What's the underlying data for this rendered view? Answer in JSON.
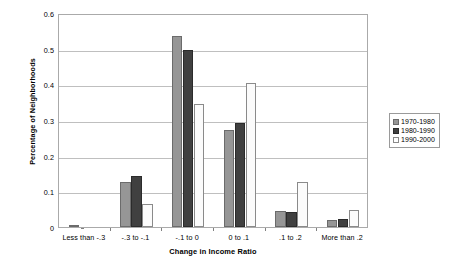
{
  "chart_data": {
    "type": "bar",
    "title": "",
    "xlabel": "Change in Income Ratio",
    "ylabel": "Percentage of Neighborhoods",
    "categories": [
      "Less than -.3",
      "-.3 to -.1",
      "-.1 to 0",
      "0 to .1",
      ".1 to .2",
      "More than .2"
    ],
    "series": [
      {
        "name": "1970-1980",
        "color": "#969696",
        "values": [
          0.003,
          0.127,
          0.535,
          0.271,
          0.046,
          0.019
        ]
      },
      {
        "name": "1980-1990",
        "color": "#404040",
        "values": [
          0.0,
          0.142,
          0.495,
          0.292,
          0.041,
          0.022
        ]
      },
      {
        "name": "1990-2000",
        "color": "#ffffff",
        "values": [
          0.0,
          0.065,
          0.345,
          0.404,
          0.126,
          0.048
        ]
      }
    ],
    "ylim": [
      0,
      0.6
    ],
    "ytick_labels": [
      "0",
      "0.1",
      "0.2",
      "0.3",
      "0.4",
      "0.5",
      "0.6"
    ],
    "ytick_values": [
      0,
      0.1,
      0.2,
      0.3,
      0.4,
      0.5,
      0.6
    ],
    "grid": true,
    "legend_position": "right"
  }
}
